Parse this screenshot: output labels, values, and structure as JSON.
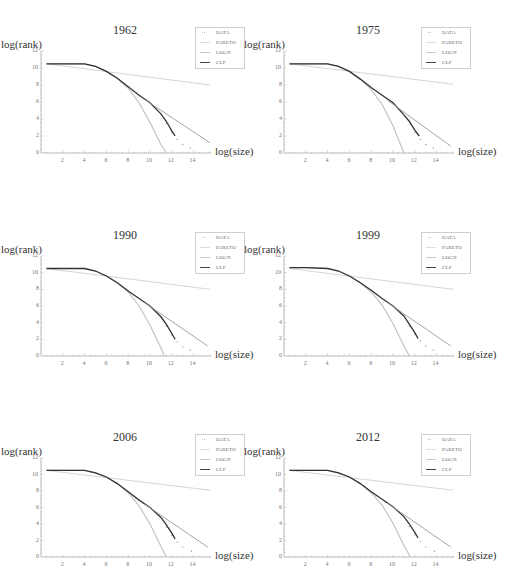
{
  "figure": {
    "x_axis_label": "log(size)",
    "y_axis_label": "log(rank)",
    "x_ticks": [
      "2",
      "4",
      "6",
      "8",
      "10",
      "12",
      "14"
    ],
    "y_ticks": [
      "0",
      "2",
      "4",
      "6",
      "8",
      "10",
      "12"
    ],
    "legend": [
      {
        "label": "DATA",
        "style": "dots",
        "color": "#bbbbbb"
      },
      {
        "label": "PARETO",
        "style": "line",
        "color": "#dddddd"
      },
      {
        "label": "LOGN",
        "style": "line",
        "color": "#c8c8c8"
      },
      {
        "label": "CLP",
        "style": "line",
        "color": "#444444"
      }
    ]
  },
  "panels": [
    {
      "title": "1962",
      "ox": 41,
      "oy": 153,
      "top": 51
    },
    {
      "title": "1975",
      "ox": 284,
      "oy": 153,
      "top": 51
    },
    {
      "title": "1990",
      "ox": 41,
      "oy": 356,
      "top": 256
    },
    {
      "title": "1999",
      "ox": 284,
      "oy": 356,
      "top": 256
    },
    {
      "title": "2006",
      "ox": 41,
      "oy": 557,
      "top": 458
    },
    {
      "title": "2012",
      "ox": 284,
      "oy": 557,
      "top": 458
    }
  ],
  "chart_data": [
    {
      "type": "line",
      "title": "1962",
      "xlabel": "log(size)",
      "ylabel": "log(rank)",
      "xlim": [
        0,
        15.5
      ],
      "ylim": [
        0,
        12
      ],
      "grid": false,
      "legend_position": "top-right",
      "series": [
        {
          "name": "DATA",
          "x": [
            0.5,
            2,
            4,
            5,
            6,
            7,
            8,
            9,
            10,
            11,
            11.5,
            12,
            12.5,
            13,
            13.7
          ],
          "y": [
            10.5,
            10.5,
            10.5,
            10.2,
            9.6,
            8.8,
            7.8,
            6.8,
            5.8,
            4.4,
            3.5,
            2.4,
            1.6,
            1.0,
            0.6
          ]
        },
        {
          "name": "PARETO",
          "x": [
            0.5,
            15.5
          ],
          "y": [
            10.5,
            8.0
          ]
        },
        {
          "name": "LOGN",
          "x": [
            0.5,
            2,
            4,
            5,
            6,
            7,
            8,
            9,
            10,
            11,
            11.5
          ],
          "y": [
            10.5,
            10.5,
            10.5,
            10.2,
            9.6,
            8.8,
            7.6,
            5.9,
            3.6,
            1.0,
            0
          ]
        },
        {
          "name": "CLP",
          "x": [
            0.5,
            2,
            4,
            5,
            6,
            7,
            8,
            9,
            10,
            11,
            11.5,
            12,
            12.3
          ],
          "y": [
            10.5,
            10.5,
            10.5,
            10.2,
            9.6,
            8.8,
            7.8,
            6.8,
            5.9,
            4.6,
            3.7,
            2.6,
            2.0
          ]
        },
        {
          "name": "CLP_tail",
          "x": [
            9.5,
            15.5
          ],
          "y": [
            6.3,
            1.2
          ]
        }
      ]
    },
    {
      "type": "line",
      "title": "1975",
      "xlabel": "log(size)",
      "ylabel": "log(rank)",
      "xlim": [
        0,
        15.5
      ],
      "ylim": [
        0,
        12
      ],
      "grid": false,
      "legend_position": "top-right",
      "series": [
        {
          "name": "DATA",
          "x": [
            0.5,
            2,
            4,
            5,
            6,
            7,
            8,
            9,
            10,
            11,
            11.5,
            12,
            12.5,
            13,
            13.7
          ],
          "y": [
            10.5,
            10.5,
            10.5,
            10.2,
            9.6,
            8.7,
            7.7,
            6.8,
            5.8,
            4.3,
            3.4,
            2.4,
            1.6,
            1.0,
            0.6
          ]
        },
        {
          "name": "PARETO",
          "x": [
            0.5,
            15.5
          ],
          "y": [
            10.5,
            8.1
          ]
        },
        {
          "name": "LOGN",
          "x": [
            0.5,
            2,
            4,
            5,
            6,
            7,
            8,
            9,
            10,
            11
          ],
          "y": [
            10.5,
            10.5,
            10.5,
            10.2,
            9.6,
            8.7,
            7.5,
            5.7,
            3.2,
            0
          ]
        },
        {
          "name": "CLP",
          "x": [
            0.5,
            2,
            4,
            5,
            6,
            7,
            8,
            9,
            10,
            11,
            11.5,
            12,
            12.4
          ],
          "y": [
            10.5,
            10.5,
            10.5,
            10.2,
            9.6,
            8.7,
            7.7,
            6.8,
            5.9,
            4.5,
            3.7,
            2.7,
            2.0
          ]
        },
        {
          "name": "CLP_tail",
          "x": [
            9.5,
            15.3
          ],
          "y": [
            6.2,
            0.8
          ]
        }
      ]
    },
    {
      "type": "line",
      "title": "1990",
      "xlabel": "log(size)",
      "ylabel": "log(rank)",
      "xlim": [
        0,
        15.5
      ],
      "ylim": [
        0,
        12
      ],
      "grid": false,
      "legend_position": "top-right",
      "series": [
        {
          "name": "DATA",
          "x": [
            0.5,
            2,
            4,
            5,
            6,
            7,
            8,
            9,
            10,
            11,
            11.5,
            12,
            12.5,
            13,
            13.7
          ],
          "y": [
            10.5,
            10.5,
            10.5,
            10.2,
            9.6,
            8.8,
            7.8,
            6.9,
            5.9,
            4.6,
            3.6,
            2.5,
            1.7,
            1.1,
            0.7
          ]
        },
        {
          "name": "PARETO",
          "x": [
            0.5,
            15.5
          ],
          "y": [
            10.5,
            8.0
          ]
        },
        {
          "name": "LOGN",
          "x": [
            0.5,
            2,
            4,
            5,
            6,
            7,
            8,
            9,
            10,
            11,
            11.3
          ],
          "y": [
            10.5,
            10.5,
            10.5,
            10.2,
            9.6,
            8.8,
            7.7,
            6.0,
            3.7,
            1.0,
            0
          ]
        },
        {
          "name": "CLP",
          "x": [
            0.5,
            2,
            4,
            5,
            6,
            7,
            8,
            9,
            10,
            11,
            11.5,
            12,
            12.3
          ],
          "y": [
            10.5,
            10.5,
            10.5,
            10.2,
            9.6,
            8.8,
            7.8,
            6.9,
            6.0,
            4.7,
            3.8,
            2.7,
            2.0
          ]
        },
        {
          "name": "CLP_tail",
          "x": [
            9.5,
            15.3
          ],
          "y": [
            6.4,
            1.2
          ]
        }
      ]
    },
    {
      "type": "line",
      "title": "1999",
      "xlabel": "log(size)",
      "ylabel": "log(rank)",
      "xlim": [
        0,
        15.5
      ],
      "ylim": [
        0,
        12
      ],
      "grid": false,
      "legend_position": "top-right",
      "series": [
        {
          "name": "DATA",
          "x": [
            0.5,
            2,
            4,
            5,
            6,
            7,
            8,
            9,
            10,
            11,
            11.5,
            12,
            12.5,
            13,
            13.7
          ],
          "y": [
            10.6,
            10.6,
            10.5,
            10.2,
            9.6,
            8.8,
            7.9,
            6.9,
            5.9,
            4.6,
            3.6,
            2.6,
            1.8,
            1.2,
            0.7
          ]
        },
        {
          "name": "PARETO",
          "x": [
            0.5,
            15.5
          ],
          "y": [
            10.5,
            8.0
          ]
        },
        {
          "name": "LOGN",
          "x": [
            0.5,
            2,
            4,
            5,
            6,
            7,
            8,
            9,
            10,
            11,
            11.5
          ],
          "y": [
            10.6,
            10.6,
            10.5,
            10.2,
            9.6,
            8.8,
            7.7,
            6.1,
            3.9,
            1.2,
            0
          ]
        },
        {
          "name": "CLP",
          "x": [
            0.5,
            2,
            4,
            5,
            6,
            7,
            8,
            9,
            10,
            11,
            11.5,
            12,
            12.3
          ],
          "y": [
            10.6,
            10.6,
            10.5,
            10.2,
            9.6,
            8.8,
            7.9,
            6.9,
            6.0,
            4.8,
            3.8,
            2.8,
            2.1
          ]
        },
        {
          "name": "CLP_tail",
          "x": [
            9.5,
            15.3
          ],
          "y": [
            6.4,
            1.2
          ]
        }
      ]
    },
    {
      "type": "line",
      "title": "2006",
      "xlabel": "log(size)",
      "ylabel": "log(rank)",
      "xlim": [
        0,
        15.5
      ],
      "ylim": [
        0,
        12
      ],
      "grid": false,
      "legend_position": "top-right",
      "series": [
        {
          "name": "DATA",
          "x": [
            0.5,
            2,
            4,
            5,
            6,
            7,
            8,
            9,
            10,
            11,
            11.5,
            12,
            12.5,
            13,
            13.8
          ],
          "y": [
            10.5,
            10.5,
            10.5,
            10.2,
            9.7,
            8.9,
            7.9,
            6.9,
            5.9,
            4.6,
            3.6,
            2.6,
            1.8,
            1.2,
            0.7
          ]
        },
        {
          "name": "PARETO",
          "x": [
            0.5,
            15.5
          ],
          "y": [
            10.5,
            8.1
          ]
        },
        {
          "name": "LOGN",
          "x": [
            0.5,
            2,
            4,
            5,
            6,
            7,
            8,
            9,
            10,
            11,
            11.5
          ],
          "y": [
            10.5,
            10.5,
            10.5,
            10.2,
            9.7,
            8.9,
            7.8,
            6.2,
            4.0,
            1.3,
            0
          ]
        },
        {
          "name": "CLP",
          "x": [
            0.5,
            2,
            4,
            5,
            6,
            7,
            8,
            9,
            10,
            11,
            11.5,
            12,
            12.3
          ],
          "y": [
            10.5,
            10.5,
            10.5,
            10.2,
            9.7,
            8.9,
            7.9,
            6.9,
            6.0,
            4.8,
            3.9,
            2.9,
            2.2
          ]
        },
        {
          "name": "CLP_tail",
          "x": [
            9.5,
            15.3
          ],
          "y": [
            6.4,
            1.2
          ]
        }
      ]
    },
    {
      "type": "line",
      "title": "2012",
      "xlabel": "log(size)",
      "ylabel": "log(rank)",
      "xlim": [
        0,
        15.5
      ],
      "ylim": [
        0,
        12
      ],
      "grid": false,
      "legend_position": "top-right",
      "series": [
        {
          "name": "DATA",
          "x": [
            0.5,
            2,
            4,
            5,
            6,
            7,
            8,
            9,
            10,
            11,
            11.5,
            12,
            12.5,
            13,
            13.8
          ],
          "y": [
            10.5,
            10.5,
            10.5,
            10.2,
            9.7,
            8.9,
            7.9,
            7.0,
            6.0,
            4.7,
            3.7,
            2.7,
            1.9,
            1.2,
            0.7
          ]
        },
        {
          "name": "PARETO",
          "x": [
            0.5,
            15.5
          ],
          "y": [
            10.5,
            8.1
          ]
        },
        {
          "name": "LOGN",
          "x": [
            0.5,
            2,
            4,
            5,
            6,
            7,
            8,
            9,
            10,
            11,
            11.6
          ],
          "y": [
            10.5,
            10.5,
            10.5,
            10.2,
            9.7,
            8.9,
            7.8,
            6.3,
            4.1,
            1.4,
            0
          ]
        },
        {
          "name": "CLP",
          "x": [
            0.5,
            2,
            4,
            5,
            6,
            7,
            8,
            9,
            10,
            11,
            11.5,
            12,
            12.3
          ],
          "y": [
            10.5,
            10.5,
            10.5,
            10.2,
            9.7,
            8.9,
            7.9,
            7.0,
            6.1,
            4.9,
            4.0,
            3.0,
            2.3
          ]
        },
        {
          "name": "CLP_tail",
          "x": [
            9.5,
            15.3
          ],
          "y": [
            6.5,
            1.2
          ]
        }
      ]
    }
  ]
}
